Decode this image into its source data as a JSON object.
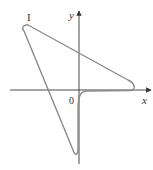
{
  "figure": {
    "panel_label": "I",
    "axes": {
      "x_label": "x",
      "y_label": "y",
      "origin_label": "0"
    },
    "colors": {
      "curve": "#8a8a8a",
      "axis": "#333333",
      "background": "#ffffff"
    },
    "curve_description": "closed-loop parametric curve: from upper-left cusp, sloping line down-right to tip near x-axis, flat along x-axis toward origin, sharp drop below origin, then straight line back up to upper-left"
  }
}
